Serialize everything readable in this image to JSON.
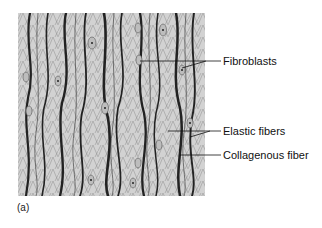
{
  "figure": {
    "caption": "(a)",
    "colors": {
      "background": "#d4d4d4",
      "fiber": "#2a2a2a",
      "mesh": "#6a6a6a",
      "cell": "#b8b8b8"
    }
  },
  "labels": [
    {
      "id": "fibroblasts",
      "text": "Fibroblasts"
    },
    {
      "id": "elastic",
      "text": "Elastic fibers"
    },
    {
      "id": "collagenous",
      "text": "Collagenous fiber"
    }
  ]
}
